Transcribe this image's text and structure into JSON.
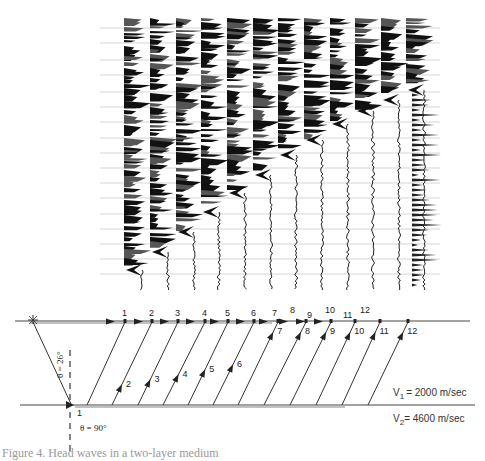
{
  "figure": {
    "seismogram": {
      "trace_count": 12,
      "description": "Seismic refraction record section with 12 traces; first arrivals marked by chevrons stepping earlier with distance",
      "traces_x": [
        130,
        156,
        182,
        207,
        233,
        259,
        284,
        310,
        336,
        361,
        387,
        412
      ],
      "first_arrival_y": [
        270,
        252,
        232,
        212,
        193,
        175,
        155,
        140,
        124,
        111,
        100,
        90
      ],
      "top_y": 18,
      "bottom_y": 290,
      "timing_lines_y": [
        28,
        43,
        60,
        75,
        92,
        107,
        122,
        138,
        153,
        168,
        183,
        198,
        214,
        229,
        244,
        259,
        274
      ]
    },
    "ray_diagram": {
      "surface_receiver_labels": [
        "1",
        "2",
        "3",
        "4",
        "5",
        "6",
        "7",
        "8",
        "9",
        "10",
        "11",
        "12"
      ],
      "upgoing_ray_labels": [
        "1",
        "2",
        "3",
        "4",
        "5",
        "6",
        "7",
        "8",
        "9",
        "10",
        "11",
        "12"
      ],
      "angle_critical": "θ = 26°",
      "angle_interface": "θ = 90°",
      "v1_label": "V",
      "v1_sub": "1",
      "v1_value": "= 2000 m/sec",
      "v2_label": "V",
      "v2_sub": "2",
      "v2_value": "= 4600 m/sec"
    },
    "caption": "Figure 4. Head waves in a two-layer medium"
  }
}
